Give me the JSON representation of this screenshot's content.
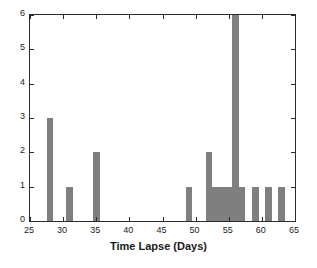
{
  "chart_data": {
    "type": "bar",
    "title": "",
    "xlabel": "Time Lapse (Days)",
    "ylabel": "",
    "xlim": [
      25,
      65
    ],
    "ylim": [
      0,
      6
    ],
    "xticks": [
      25,
      30,
      35,
      40,
      45,
      50,
      55,
      60,
      65
    ],
    "yticks": [
      0,
      1,
      2,
      3,
      4,
      5,
      6
    ],
    "grid": false,
    "legend": null,
    "bar_color": "#7f7f7f",
    "bin_width": 1,
    "categories": [
      28,
      31,
      35,
      49,
      52,
      53,
      54,
      55,
      56,
      57,
      59,
      61,
      63
    ],
    "values": [
      3,
      1,
      2,
      1,
      2,
      1,
      1,
      1,
      6,
      1,
      1,
      1,
      1
    ],
    "bars": [
      {
        "x": 28,
        "count": 3
      },
      {
        "x": 31,
        "count": 1
      },
      {
        "x": 35,
        "count": 2
      },
      {
        "x": 49,
        "count": 1
      },
      {
        "x": 52,
        "count": 2
      },
      {
        "x": 53,
        "count": 1
      },
      {
        "x": 54,
        "count": 1
      },
      {
        "x": 55,
        "count": 1
      },
      {
        "x": 56,
        "count": 6
      },
      {
        "x": 57,
        "count": 1
      },
      {
        "x": 59,
        "count": 1
      },
      {
        "x": 61,
        "count": 1
      },
      {
        "x": 63,
        "count": 1
      }
    ]
  },
  "axis": {
    "xtick_labels": [
      "25",
      "30",
      "35",
      "40",
      "45",
      "50",
      "55",
      "60",
      "65"
    ],
    "ytick_labels": [
      "0",
      "1",
      "2",
      "3",
      "4",
      "5",
      "6"
    ],
    "x_axis_title": "Time Lapse (Days)"
  }
}
